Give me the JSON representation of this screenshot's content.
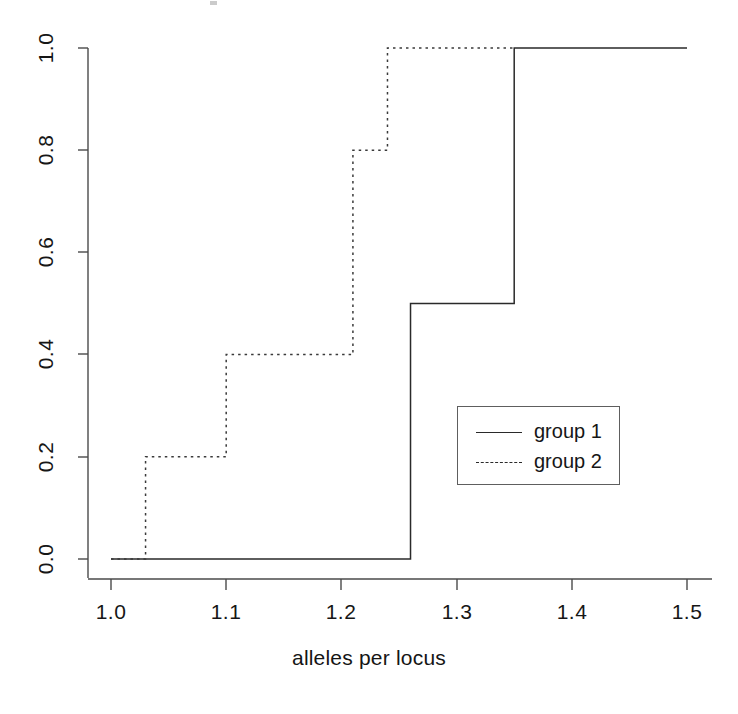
{
  "figure": {
    "background_color": "#ffffff",
    "line_color": "#2a2a2a",
    "axis_color": "#4a4a4a"
  },
  "xaxis": {
    "title": "alleles per locus",
    "ticks": [
      {
        "value": 1.0,
        "label": "1.0",
        "px": 111
      },
      {
        "value": 1.1,
        "label": "1.1",
        "px": 226
      },
      {
        "value": 1.2,
        "label": "1.2",
        "px": 341
      },
      {
        "value": 1.3,
        "label": "1.3",
        "px": 457
      },
      {
        "value": 1.4,
        "label": "1.4",
        "px": 572
      },
      {
        "value": 1.5,
        "label": "1.5",
        "px": 687
      }
    ],
    "range": [
      1.0,
      1.5
    ]
  },
  "yaxis": {
    "title": "",
    "ticks": [
      {
        "value": 1.0,
        "label": "1.0",
        "px": 48
      },
      {
        "value": 0.8,
        "label": "0.8",
        "px": 150
      },
      {
        "value": 0.6,
        "label": "0.6",
        "px": 252
      },
      {
        "value": 0.4,
        "label": "0.4",
        "px": 354
      },
      {
        "value": 0.2,
        "label": "0.2",
        "px": 457
      },
      {
        "value": 0.0,
        "label": "0.0",
        "px": 559
      }
    ],
    "range": [
      0.0,
      1.0
    ]
  },
  "legend": {
    "position": "center-right",
    "entries": [
      {
        "label": "group 1",
        "style": "solid"
      },
      {
        "label": "group 2",
        "style": "dotted"
      }
    ]
  },
  "chart_data": {
    "type": "line",
    "subtype": "ecdf-step",
    "title": "",
    "xlabel": "alleles per locus",
    "ylabel": "",
    "xlim": [
      1.0,
      1.5
    ],
    "ylim": [
      0.0,
      1.0
    ],
    "grid": false,
    "step_direction": "vertical-then-horizontal",
    "series": [
      {
        "name": "group 1",
        "style": "solid",
        "jump_points": [
          {
            "x": 1.26,
            "from": 0.0,
            "to": 0.5
          },
          {
            "x": 1.35,
            "from": 0.5,
            "to": 1.0
          }
        ],
        "points": [
          {
            "x": 1.0,
            "y": 0.0
          },
          {
            "x": 1.26,
            "y": 0.0
          },
          {
            "x": 1.26,
            "y": 0.5
          },
          {
            "x": 1.35,
            "y": 0.5
          },
          {
            "x": 1.35,
            "y": 1.0
          },
          {
            "x": 1.5,
            "y": 1.0
          }
        ]
      },
      {
        "name": "group 2",
        "style": "dotted",
        "jump_points": [
          {
            "x": 1.03,
            "from": 0.0,
            "to": 0.2
          },
          {
            "x": 1.1,
            "from": 0.2,
            "to": 0.4
          },
          {
            "x": 1.21,
            "from": 0.4,
            "to": 0.8
          },
          {
            "x": 1.24,
            "from": 0.8,
            "to": 1.0
          }
        ],
        "points": [
          {
            "x": 1.0,
            "y": 0.0
          },
          {
            "x": 1.03,
            "y": 0.0
          },
          {
            "x": 1.03,
            "y": 0.2
          },
          {
            "x": 1.1,
            "y": 0.2
          },
          {
            "x": 1.1,
            "y": 0.4
          },
          {
            "x": 1.21,
            "y": 0.4
          },
          {
            "x": 1.21,
            "y": 0.8
          },
          {
            "x": 1.24,
            "y": 0.8
          },
          {
            "x": 1.24,
            "y": 1.0
          },
          {
            "x": 1.35,
            "y": 1.0
          }
        ]
      }
    ]
  }
}
